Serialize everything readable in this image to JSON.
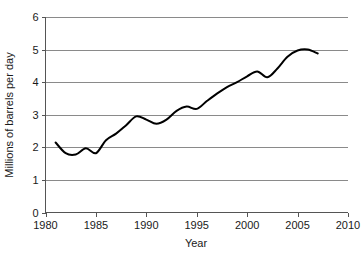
{
  "chart_data": {
    "type": "line",
    "title": "",
    "xlabel": "Year",
    "ylabel": "Millions of barrels per day",
    "xlim": [
      1980,
      2010
    ],
    "ylim": [
      0,
      6
    ],
    "grid": "horizontal",
    "legend": "none",
    "xticks": [
      1980,
      1985,
      1990,
      1995,
      2000,
      2005,
      2010
    ],
    "yticks": [
      0,
      1,
      2,
      3,
      4,
      5,
      6
    ],
    "xtick_labels": [
      "1980",
      "1985",
      "1990",
      "1995",
      "2000",
      "2005",
      "2010"
    ],
    "ytick_labels": [
      "0",
      "1",
      "2",
      "3",
      "4",
      "5",
      "6"
    ],
    "line_color": "#000000",
    "grid_color": "#8a8a8a",
    "series": [
      {
        "name": "Millions of barrels per day",
        "x": [
          1981,
          1982,
          1983,
          1984,
          1985,
          1986,
          1987,
          1988,
          1989,
          1990,
          1991,
          1992,
          1993,
          1994,
          1995,
          1996,
          1997,
          1998,
          1999,
          2000,
          2001,
          2002,
          2003,
          2004,
          2005,
          2006,
          2007
        ],
        "values": [
          2.15,
          1.82,
          1.78,
          1.97,
          1.82,
          2.22,
          2.42,
          2.68,
          2.95,
          2.85,
          2.72,
          2.85,
          3.12,
          3.25,
          3.18,
          3.42,
          3.65,
          3.85,
          4.0,
          4.18,
          4.33,
          4.15,
          4.42,
          4.78,
          4.97,
          5.0,
          4.88
        ]
      }
    ]
  },
  "axes": {
    "y_title": "Millions of barrels per day",
    "x_title": "Year"
  }
}
